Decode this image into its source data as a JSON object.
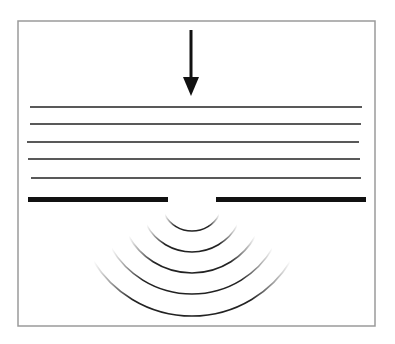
{
  "diagram": {
    "type": "single-slit diffraction",
    "frame": {
      "x": 18,
      "y": 21,
      "width": 357,
      "height": 305,
      "stroke": "#9a9a9a"
    },
    "incident_arrow": {
      "x": 191,
      "y1": 30,
      "y2": 96,
      "color": "#111111"
    },
    "plane_wavefronts": [
      {
        "y": 107,
        "x1": 30,
        "x2": 362
      },
      {
        "y": 124,
        "x1": 30,
        "x2": 361
      },
      {
        "y": 142,
        "x1": 27,
        "x2": 359
      },
      {
        "y": 159,
        "x1": 28,
        "x2": 360
      },
      {
        "y": 178,
        "x1": 31,
        "x2": 361
      }
    ],
    "barrier": {
      "y": 199.5,
      "thickness": 5,
      "left": {
        "x1": 28,
        "x2": 168
      },
      "right": {
        "x1": 216,
        "x2": 366
      },
      "color": "#111111"
    },
    "slit_center": {
      "x": 192,
      "y": 200
    },
    "circular_wavefronts_radii": [
      31,
      52,
      73,
      94,
      116
    ],
    "line_color": "#222222"
  }
}
